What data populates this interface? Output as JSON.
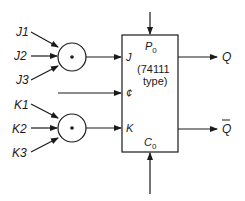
{
  "diagram": {
    "inputs_j": [
      "J1",
      "J2",
      "J3"
    ],
    "inputs_k": [
      "K1",
      "K2",
      "K3"
    ],
    "gate_symbol": "AND (dot)",
    "flipflop": {
      "pin_j": "J",
      "pin_clock": "¢",
      "pin_k": "K",
      "pin_preset": "P",
      "pin_preset_sub": "0",
      "pin_clear": "C",
      "pin_clear_sub": "0",
      "type_line1": "(74111",
      "type_line2": "type)"
    },
    "outputs": {
      "q": "Q",
      "q_bar": "Q"
    },
    "colors": {
      "line": "#1a1a1a",
      "background": "#ffffff"
    }
  }
}
